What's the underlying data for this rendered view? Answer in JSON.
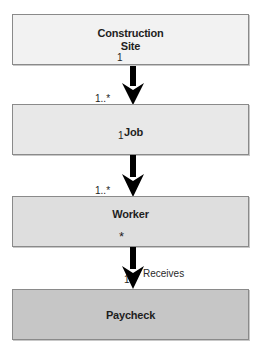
{
  "diagram": {
    "colors": {
      "box1_fill": "#f2f2f2",
      "box2_fill": "#e8e8e8",
      "box3_fill": "#dedede",
      "box4_fill": "#c6c6c6",
      "border": "#8a8a8a",
      "arrow": "#000000"
    },
    "classes": [
      {
        "id": "construction-site",
        "line1": "Construction",
        "line2": "Site"
      },
      {
        "id": "job",
        "label": "Job"
      },
      {
        "id": "worker",
        "label": "Worker"
      },
      {
        "id": "paycheck",
        "label": "Paycheck"
      }
    ],
    "associations": [
      {
        "from": "Construction Site",
        "to": "Job",
        "source_multiplicity": "1",
        "target_multiplicity": "1..*",
        "label": ""
      },
      {
        "from": "Job",
        "to": "Worker",
        "source_multiplicity": "1",
        "target_multiplicity": "1..*",
        "label": ""
      },
      {
        "from": "Worker",
        "to": "Paycheck",
        "source_multiplicity": "*",
        "target_multiplicity": "1",
        "label": "Receives"
      }
    ],
    "mult_labels": {
      "one": "1",
      "one_to_many_prefix": "1..",
      "many": "*"
    }
  }
}
